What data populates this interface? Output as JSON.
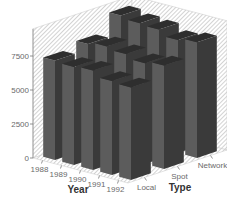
{
  "chart_data": {
    "type": "bar3d",
    "title": "",
    "xlabel": "Year",
    "zlabel": "Type",
    "ylabel": "",
    "categories": [
      "1988",
      "1989",
      "1990",
      "1991",
      "1992"
    ],
    "series": [
      {
        "name": "Local",
        "values": [
          7300,
          7200,
          7300,
          6900,
          6800
        ]
      },
      {
        "name": "Spot",
        "values": [
          7700,
          7900,
          7700,
          7400,
          7600
        ]
      },
      {
        "name": "Network",
        "values": [
          9000,
          8800,
          8700,
          8300,
          8500
        ]
      }
    ],
    "yticks": [
      "0",
      "2500",
      "5000",
      "7500"
    ],
    "ylim": [
      0,
      9500
    ],
    "grid": false,
    "background": "hatched",
    "legend": "none"
  },
  "colors": {
    "bar_front": "#5c5c5c",
    "bar_side": "#3a3a3a",
    "bar_top": "#2e2e2e",
    "hatch": "#b0b0b0"
  }
}
